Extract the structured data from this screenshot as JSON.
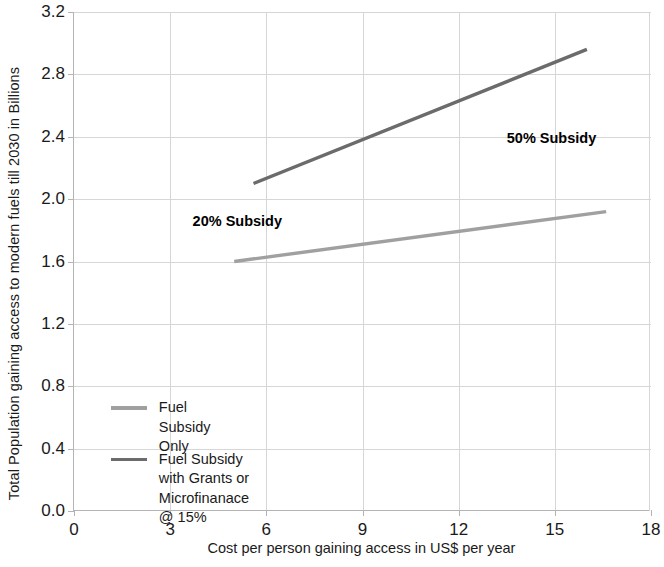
{
  "chart_data": {
    "type": "line",
    "title": "",
    "xlabel": "Cost per person gaining access in US$ per year",
    "ylabel": "Total Population gaining access to modern fuels till 2030 in Billions",
    "xlim": [
      0,
      18
    ],
    "ylim": [
      0.0,
      3.2
    ],
    "xticks": [
      "0",
      "3",
      "6",
      "9",
      "12",
      "15",
      "18"
    ],
    "xtick_values": [
      0,
      3,
      6,
      9,
      12,
      15,
      18
    ],
    "yticks": [
      "0.0",
      "0.4",
      "0.8",
      "1.2",
      "1.6",
      "2.0",
      "2.4",
      "2.8",
      "3.2"
    ],
    "ytick_values": [
      0.0,
      0.4,
      0.8,
      1.2,
      1.6,
      2.0,
      2.4,
      2.8,
      3.2
    ],
    "grid": true,
    "legend_position": "inside-lower-left",
    "series": [
      {
        "name": "Fuel Subsidy Only",
        "color": "#a0a0a0",
        "x": [
          5.0,
          16.6
        ],
        "values": [
          1.6,
          1.92
        ]
      },
      {
        "name": "Fuel Subsidy with Grants or\nMicrofinanace @ 15%",
        "color": "#6b6b6b",
        "x": [
          5.6,
          16.0
        ],
        "values": [
          2.1,
          2.96
        ]
      }
    ],
    "annotations": [
      {
        "text": "20% Subsidy",
        "x": 3.7,
        "y": 1.85
      },
      {
        "text": "50% Subsidy",
        "x": 13.5,
        "y": 2.38
      }
    ]
  }
}
